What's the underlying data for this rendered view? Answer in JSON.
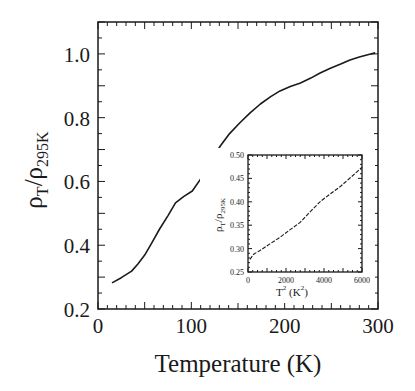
{
  "chart_data": [
    {
      "id": "main",
      "type": "line",
      "title": "",
      "xlabel": "Temperature (K)",
      "ylabel": "ρT/ρ295K",
      "ylabel_parts": {
        "rho1": "ρ",
        "sub1": "T",
        "slash": "/",
        "rho2": "ρ",
        "sub2": "295K"
      },
      "xlim": [
        0,
        300
      ],
      "ylim": [
        0.2,
        1.1
      ],
      "xticks": [
        0,
        100,
        200,
        300
      ],
      "xtick_labels": [
        "0",
        "100",
        "200",
        "300"
      ],
      "yticks": [
        0.2,
        0.4,
        0.6,
        0.8,
        1.0
      ],
      "ytick_labels": [
        "0.2",
        "0.4",
        "0.6",
        "0.8",
        "1.0"
      ],
      "grid": false,
      "legend": null,
      "series": [
        {
          "name": "resistivity ratio",
          "x": [
            15,
            25,
            36,
            43,
            50,
            58,
            66,
            75,
            83,
            92,
            101,
            110,
            120,
            131,
            141,
            152,
            163,
            174,
            185,
            195,
            206,
            217,
            228,
            238,
            249,
            260,
            270,
            280,
            290,
            297
          ],
          "y": [
            0.282,
            0.298,
            0.319,
            0.342,
            0.369,
            0.409,
            0.451,
            0.493,
            0.533,
            0.553,
            0.57,
            0.608,
            0.66,
            0.711,
            0.75,
            0.784,
            0.815,
            0.843,
            0.866,
            0.884,
            0.898,
            0.909,
            0.924,
            0.94,
            0.955,
            0.968,
            0.981,
            0.99,
            0.998,
            1.003
          ]
        }
      ]
    },
    {
      "id": "inset",
      "type": "line",
      "title": "",
      "xlabel": "T² (K²)",
      "xlabel_parts": {
        "base": "T",
        "sup1": "2",
        "unit_open": " (K",
        "sup2": "2",
        "unit_close": ")"
      },
      "ylabel": "ρT/ρ295K",
      "ylabel_parts": {
        "rho1": "ρ",
        "sub1": "T",
        "slash": "/",
        "rho2": "ρ",
        "sub2": "295K"
      },
      "xlim": [
        0,
        6000
      ],
      "ylim": [
        0.25,
        0.5
      ],
      "xticks": [
        0,
        2000,
        4000,
        6000
      ],
      "xtick_labels": [
        "0",
        "2000",
        "4000",
        "6000"
      ],
      "yticks": [
        0.25,
        0.3,
        0.35,
        0.4,
        0.45,
        0.5
      ],
      "ytick_labels": [
        "0.25",
        "0.30",
        "0.35",
        "0.40",
        "0.45",
        "0.50"
      ],
      "grid": false,
      "legend": null,
      "series": [
        {
          "name": "resistivity ratio vs T²",
          "x": [
            100,
            300,
            630,
            1150,
            1680,
            2200,
            2740,
            3250,
            3790,
            4300,
            4840,
            5400,
            6000
          ],
          "y": [
            0.277,
            0.288,
            0.296,
            0.31,
            0.324,
            0.34,
            0.356,
            0.378,
            0.4,
            0.416,
            0.432,
            0.452,
            0.474
          ]
        }
      ]
    }
  ],
  "colors": {
    "line": "#1a1a1a",
    "axis": "#1a1a1a",
    "background": "#ffffff"
  }
}
